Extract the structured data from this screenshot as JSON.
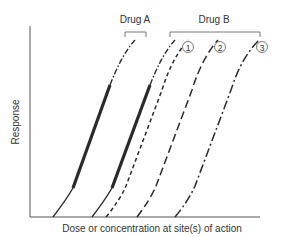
{
  "diagram": {
    "ylabel": "Response",
    "xlabel": "Dose or concentration at site(s) of action",
    "groups": [
      {
        "label": "Drug A"
      },
      {
        "label": "Drug B"
      }
    ],
    "curve_markers": [
      "1",
      "2",
      "3"
    ],
    "curves": [
      {
        "id": "drug-a",
        "group": "Drug A",
        "style": "solid-thick-with-dash-dot-top"
      },
      {
        "id": "drug-b-ref",
        "group": "Drug B",
        "style": "solid-thick-with-dash-dot-top"
      },
      {
        "id": "drug-b-1",
        "group": "Drug B",
        "marker": "1",
        "style": "short-dashed"
      },
      {
        "id": "drug-b-2",
        "group": "Drug B",
        "marker": "2",
        "style": "long-dashed"
      },
      {
        "id": "drug-b-3",
        "group": "Drug B",
        "marker": "3",
        "style": "dash-dot"
      }
    ],
    "colors": {
      "line": "#2a2a2a",
      "axis": "#555555",
      "text": "#333333"
    }
  }
}
